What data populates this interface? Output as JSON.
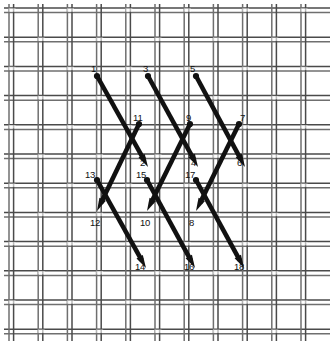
{
  "figure": {
    "type": "stitch-diagram",
    "width": 334,
    "height": 345,
    "background_color": "#ffffff",
    "stitch_color": "#111111",
    "grid": {
      "thread_color": "#6f6f6f",
      "thread_color_dark": "#4a4a4a",
      "weave": "double-thread plain weave",
      "pitch": 29.2,
      "thread_gap": 4.6,
      "thread_width": 1.5,
      "origin_x": 9,
      "origin_y": 8,
      "columns": 11,
      "rows": 12
    },
    "labels": [
      {
        "id": "1",
        "text": "1",
        "x": 91,
        "y": 64,
        "anchor": "point-1"
      },
      {
        "id": "2",
        "text": "2",
        "x": 140,
        "y": 158,
        "anchor": "point-2"
      },
      {
        "id": "3",
        "text": "3",
        "x": 143,
        "y": 64,
        "anchor": "point-3"
      },
      {
        "id": "4",
        "text": "4",
        "x": 191,
        "y": 158,
        "anchor": "point-4"
      },
      {
        "id": "5",
        "text": "5",
        "x": 190,
        "y": 64,
        "anchor": "point-5"
      },
      {
        "id": "6",
        "text": "6",
        "x": 237,
        "y": 158,
        "anchor": "point-6"
      },
      {
        "id": "7",
        "text": "7",
        "x": 240,
        "y": 113,
        "anchor": "point-7"
      },
      {
        "id": "8",
        "text": "8",
        "x": 189,
        "y": 218,
        "anchor": "point-8"
      },
      {
        "id": "9",
        "text": "9",
        "x": 186,
        "y": 113,
        "anchor": "point-9"
      },
      {
        "id": "10",
        "text": "10",
        "x": 140,
        "y": 218,
        "anchor": "point-10"
      },
      {
        "id": "11",
        "text": "11",
        "x": 133,
        "y": 113,
        "anchor": "point-11"
      },
      {
        "id": "12",
        "text": "12",
        "x": 90,
        "y": 218,
        "anchor": "point-12"
      },
      {
        "id": "13",
        "text": "13",
        "x": 85,
        "y": 170,
        "anchor": "point-13"
      },
      {
        "id": "14",
        "text": "14",
        "x": 135,
        "y": 262,
        "anchor": "point-14"
      },
      {
        "id": "15",
        "text": "15",
        "x": 136,
        "y": 170,
        "anchor": "point-15"
      },
      {
        "id": "16",
        "text": "16",
        "x": 184,
        "y": 262,
        "anchor": "point-16"
      },
      {
        "id": "17",
        "text": "17",
        "x": 185,
        "y": 170,
        "anchor": "point-17"
      },
      {
        "id": "18",
        "text": "18",
        "x": 234,
        "y": 262,
        "anchor": "point-18"
      }
    ],
    "stitches": [
      {
        "name": "stitch-1-2",
        "from": "1",
        "to": "2",
        "x1": 97,
        "y1": 76,
        "x2": 148,
        "y2": 167,
        "dot": "start",
        "arrow": "end"
      },
      {
        "name": "stitch-3-4",
        "from": "3",
        "to": "4",
        "x1": 148,
        "y1": 76,
        "x2": 198,
        "y2": 167,
        "dot": "start",
        "arrow": "end"
      },
      {
        "name": "stitch-5-6",
        "from": "5",
        "to": "6",
        "x1": 196,
        "y1": 76,
        "x2": 245,
        "y2": 167,
        "dot": "start",
        "arrow": "end"
      },
      {
        "name": "stitch-11-12",
        "from": "11",
        "to": "12",
        "x1": 139,
        "y1": 124,
        "x2": 97,
        "y2": 211,
        "dot": "start",
        "arrow": "end"
      },
      {
        "name": "stitch-9-10",
        "from": "9",
        "to": "10",
        "x1": 190,
        "y1": 124,
        "x2": 147,
        "y2": 211,
        "dot": "start",
        "arrow": "end"
      },
      {
        "name": "stitch-7-8",
        "from": "7",
        "to": "8",
        "x1": 239,
        "y1": 124,
        "x2": 196,
        "y2": 211,
        "dot": "start",
        "arrow": "end"
      },
      {
        "name": "stitch-13-14",
        "from": "13",
        "to": "14",
        "x1": 97,
        "y1": 180,
        "x2": 146,
        "y2": 268,
        "dot": "start",
        "arrow": "end"
      },
      {
        "name": "stitch-15-16",
        "from": "15",
        "to": "16",
        "x1": 147,
        "y1": 180,
        "x2": 195,
        "y2": 268,
        "dot": "start",
        "arrow": "end"
      },
      {
        "name": "stitch-17-18",
        "from": "17",
        "to": "18",
        "x1": 196,
        "y1": 180,
        "x2": 244,
        "y2": 268,
        "dot": "start",
        "arrow": "end"
      }
    ]
  }
}
